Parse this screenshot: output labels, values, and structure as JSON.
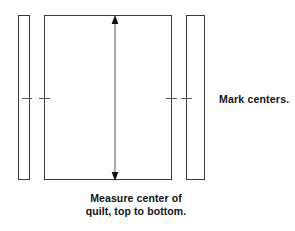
{
  "diagram": {
    "title": "Measure center of quilt, top to bottom",
    "shapes": [
      {
        "name": "left-border-strip",
        "label": ""
      },
      {
        "name": "quilt-body",
        "label": ""
      },
      {
        "name": "right-border-strip",
        "label": ""
      }
    ],
    "annotations": {
      "side_label": "Mark centers.",
      "caption_line_1": "Measure center of",
      "caption_line_2": "quilt, top to bottom."
    },
    "ticks": [
      {
        "name": "tick-left-outer"
      },
      {
        "name": "tick-left-inner"
      },
      {
        "name": "tick-right-inner"
      },
      {
        "name": "tick-right-outer"
      }
    ],
    "arrow": {
      "name": "vertical-measure-arrow",
      "direction": "double-headed-vertical"
    },
    "colors": {
      "stroke": "#3a3a3a",
      "tick_stroke": "#555555",
      "text": "#111111",
      "background": "#ffffff"
    }
  }
}
